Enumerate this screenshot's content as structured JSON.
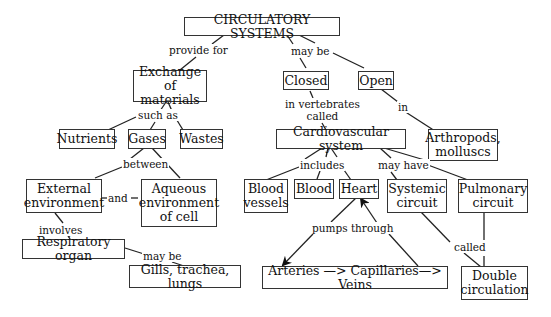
{
  "diagram": {
    "title": "CIRCULATORY SYSTEMS",
    "nodes": {
      "root": "CIRCULATORY SYSTEMS",
      "exchange": "Exchange of\nmaterials",
      "closed": "Closed",
      "open": "Open",
      "nutrients": "Nutrients",
      "gases": "Gases",
      "wastes": "Wastes",
      "cardio": "Cardiovascular system",
      "arthropods": "Arthropods,\nmolluscs",
      "external": "External\nenvironment",
      "aqueous": "Aqueous\nenvironment\nof cell",
      "vessels": "Blood\nvessels",
      "blood": "Blood",
      "heart": "Heart",
      "systemic": "Systemic\ncircuit",
      "pulmonary": "Pulmonary\ncircuit",
      "respiratory": "Respiratory organ",
      "gills": "Gills, trachea, lungs",
      "arteries": "Arteries —> Capillaries—> Veins",
      "double": "Double\ncirculation"
    },
    "links": {
      "provide_for": "provide for",
      "may_be_top": "may be",
      "such_as": "such as",
      "in_vertebrates": "in vertebrates\ncalled",
      "in": "in",
      "between": "between",
      "and": "and",
      "includes": "includes",
      "may_have": "may have",
      "involves": "involves",
      "may_be_resp": "may be",
      "pumps_through": "pumps through",
      "called": "called"
    },
    "colors": {
      "line": "#222222",
      "border": "#333333",
      "text": "#111111",
      "background": "#ffffff"
    }
  }
}
